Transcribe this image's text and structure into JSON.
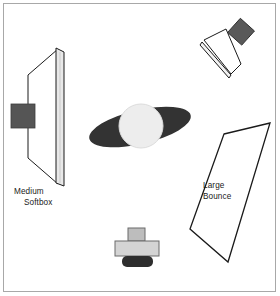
{
  "diagram": {
    "background_color": "#ffffff",
    "border_color": "#a8a8a8",
    "labels": {
      "softbox": {
        "line1": "Medium",
        "line2": "Softbox"
      },
      "bounce": {
        "line1": "Large",
        "line2": "Bounce"
      }
    },
    "elements": [
      {
        "name": "medium-softbox",
        "type": "light-modifier",
        "label": "Medium Softbox",
        "position": "left",
        "fill": "#ffffff",
        "panel_fill": "#e8e8e8",
        "head_fill": "#555555",
        "stroke": "#000000"
      },
      {
        "name": "subject-body",
        "type": "subject-shoulders",
        "fill": "#333333",
        "stroke": "none"
      },
      {
        "name": "subject-head",
        "type": "subject-head",
        "fill": "#ededed",
        "stroke": "#d6d6d6"
      },
      {
        "name": "hair-light",
        "type": "light-fixture",
        "position": "top-right",
        "reflector_fill": "#ffffff",
        "housing_fill": "#595959",
        "stroke": "#000000"
      },
      {
        "name": "large-bounce",
        "type": "reflector-card",
        "label": "Large Bounce",
        "position": "right",
        "fill": "#ffffff",
        "stroke": "#000000"
      },
      {
        "name": "camera",
        "type": "camera",
        "position": "bottom-center",
        "body_fill": "#d4d4d4",
        "lens_fill": "#2e2e2e",
        "viewfinder_fill": "#bdbdbd",
        "stroke": "#6b6b6b"
      }
    ]
  }
}
